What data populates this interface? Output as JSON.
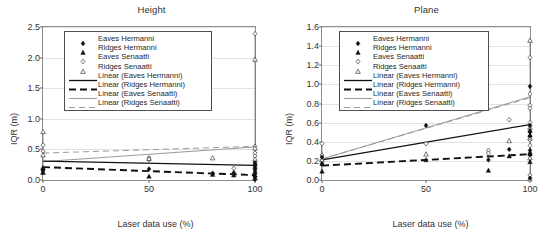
{
  "figure": {
    "panels": [
      "height",
      "plane"
    ]
  },
  "legend": {
    "entries": [
      {
        "label": "Eaves Hermanni",
        "key": "filled-diamond-marker"
      },
      {
        "label": "Ridges Hermanni",
        "key": "filled-triangle-marker"
      },
      {
        "label": "Eaves Senaatti",
        "key": "open-diamond-marker"
      },
      {
        "label": "Ridges Senaatti",
        "key": "open-triangle-marker"
      },
      {
        "label": "Linear (Eaves Hermanni)",
        "key": "solid-black-line"
      },
      {
        "label": "Linear (Ridges Hermanni)",
        "key": "dashed-black-line"
      },
      {
        "label": "Linear (Eaves Senaatti)",
        "key": "solid-gray-line"
      },
      {
        "label": "Linear (Ridges Senaatti)",
        "key": "dashed-gray-line"
      }
    ]
  },
  "colors": {
    "marker_dark": "#111111",
    "marker_open_stroke": "#3d3d3d",
    "trend_dark": "#111111",
    "trend_gray": "#9a9a9a",
    "axis": "#8d8d8d",
    "grid": "#e2e2e2",
    "text": "#333333"
  },
  "chart_data": [
    {
      "id": "height",
      "type": "scatter",
      "title": "Height",
      "xlabel": "Laser data use (%)",
      "ylabel": "IQR (m)",
      "xlim": [
        0,
        100
      ],
      "ylim": [
        0,
        2.5
      ],
      "xticks": [
        0,
        50,
        100
      ],
      "yticks": [
        0.0,
        0.5,
        1.0,
        1.5,
        2.0,
        2.5
      ],
      "ytick_labels": [
        "0.0",
        "0.5",
        "1.0",
        "1.5",
        "2.0",
        "2.5"
      ],
      "xtick_labels": [
        "0",
        "50",
        "100"
      ],
      "grid": "horizontal",
      "legend_position": "top-left",
      "series": [
        {
          "name": "Eaves Hermanni",
          "marker": "filled-diamond",
          "points": [
            {
              "x": 0,
              "y": 0.15
            },
            {
              "x": 0,
              "y": 0.17
            },
            {
              "x": 50,
              "y": 0.18
            },
            {
              "x": 80,
              "y": 0.11
            },
            {
              "x": 90,
              "y": 0.12
            },
            {
              "x": 100,
              "y": 0.28
            },
            {
              "x": 100,
              "y": 0.23
            },
            {
              "x": 100,
              "y": 0.16
            },
            {
              "x": 100,
              "y": 0.1
            },
            {
              "x": 100,
              "y": 0.05
            },
            {
              "x": 100,
              "y": 0.01
            }
          ]
        },
        {
          "name": "Ridges Hermanni",
          "marker": "filled-triangle",
          "points": [
            {
              "x": 0,
              "y": 0.2
            },
            {
              "x": 0,
              "y": 0.12
            },
            {
              "x": 50,
              "y": 0.06
            },
            {
              "x": 80,
              "y": 0.09
            },
            {
              "x": 90,
              "y": 0.08
            },
            {
              "x": 100,
              "y": 0.27
            },
            {
              "x": 100,
              "y": 0.21
            },
            {
              "x": 100,
              "y": 0.14
            },
            {
              "x": 100,
              "y": 0.08
            }
          ]
        },
        {
          "name": "Eaves Senaatti",
          "marker": "open-diamond",
          "points": [
            {
              "x": 0,
              "y": 0.57
            },
            {
              "x": 0,
              "y": 0.47
            },
            {
              "x": 0,
              "y": 0.18
            },
            {
              "x": 50,
              "y": 0.36
            },
            {
              "x": 50,
              "y": 0.33
            },
            {
              "x": 90,
              "y": 0.19
            },
            {
              "x": 100,
              "y": 2.39
            },
            {
              "x": 100,
              "y": 0.55
            },
            {
              "x": 100,
              "y": 0.44
            },
            {
              "x": 100,
              "y": 0.39
            },
            {
              "x": 100,
              "y": 0.31
            },
            {
              "x": 100,
              "y": 0.25
            },
            {
              "x": 100,
              "y": 0.2
            }
          ]
        },
        {
          "name": "Ridges Senaatti",
          "marker": "open-triangle",
          "points": [
            {
              "x": 0,
              "y": 0.79
            },
            {
              "x": 0,
              "y": 0.41
            },
            {
              "x": 0,
              "y": 0.13
            },
            {
              "x": 50,
              "y": 0.35
            },
            {
              "x": 80,
              "y": 0.36
            },
            {
              "x": 100,
              "y": 1.97
            },
            {
              "x": 100,
              "y": 0.52
            },
            {
              "x": 100,
              "y": 0.34
            },
            {
              "x": 100,
              "y": 0.03
            }
          ]
        }
      ],
      "trendlines": [
        {
          "name": "Linear (Eaves Hermanni)",
          "style": "solid-dark",
          "y0": 0.31,
          "y1": 0.24
        },
        {
          "name": "Linear (Ridges Hermanni)",
          "style": "dashed-dark",
          "y0": 0.21,
          "y1": 0.08
        },
        {
          "name": "Linear (Eaves Senaatti)",
          "style": "solid-gray",
          "y0": 0.3,
          "y1": 0.54
        },
        {
          "name": "Linear (Ridges Senaatti)",
          "style": "dashed-gray",
          "y0": 0.44,
          "y1": 0.55
        }
      ]
    },
    {
      "id": "plane",
      "type": "scatter",
      "title": "Plane",
      "xlabel": "Laser data use (%)",
      "ylabel": "IQR (m)",
      "xlim": [
        0,
        100
      ],
      "ylim": [
        0,
        1.6
      ],
      "xticks": [
        0,
        50,
        100
      ],
      "yticks": [
        0.0,
        0.2,
        0.4,
        0.6,
        0.8,
        1.0,
        1.2,
        1.4,
        1.6
      ],
      "ytick_labels": [
        "0.0",
        "0.2",
        "0.4",
        "0.6",
        "0.8",
        "1.0",
        "1.2",
        "1.4",
        "1.6"
      ],
      "xtick_labels": [
        "0",
        "50",
        "100"
      ],
      "grid": "horizontal",
      "legend_position": "top-left",
      "series": [
        {
          "name": "Eaves Hermanni",
          "marker": "filled-diamond",
          "points": [
            {
              "x": 0,
              "y": 0.24
            },
            {
              "x": 0,
              "y": 0.17
            },
            {
              "x": 50,
              "y": 0.57
            },
            {
              "x": 80,
              "y": 0.21
            },
            {
              "x": 90,
              "y": 0.32
            },
            {
              "x": 100,
              "y": 0.98
            },
            {
              "x": 100,
              "y": 0.57
            },
            {
              "x": 100,
              "y": 0.5
            },
            {
              "x": 100,
              "y": 0.46
            },
            {
              "x": 100,
              "y": 0.31
            },
            {
              "x": 100,
              "y": 0.27
            },
            {
              "x": 100,
              "y": 0.02
            }
          ]
        },
        {
          "name": "Ridges Hermanni",
          "marker": "filled-triangle",
          "points": [
            {
              "x": 0,
              "y": 0.17
            },
            {
              "x": 0,
              "y": 0.09
            },
            {
              "x": 50,
              "y": 0.21
            },
            {
              "x": 80,
              "y": 0.1
            },
            {
              "x": 90,
              "y": 0.25
            },
            {
              "x": 100,
              "y": 0.52
            },
            {
              "x": 100,
              "y": 0.47
            },
            {
              "x": 100,
              "y": 0.29
            },
            {
              "x": 100,
              "y": 0.27
            },
            {
              "x": 100,
              "y": 0.19
            }
          ]
        },
        {
          "name": "Eaves Senaatti",
          "marker": "open-diamond",
          "points": [
            {
              "x": 0,
              "y": 0.38
            },
            {
              "x": 0,
              "y": 0.26
            },
            {
              "x": 0,
              "y": 0.21
            },
            {
              "x": 50,
              "y": 0.38
            },
            {
              "x": 80,
              "y": 0.31
            },
            {
              "x": 80,
              "y": 0.28
            },
            {
              "x": 90,
              "y": 0.63
            },
            {
              "x": 100,
              "y": 1.28
            },
            {
              "x": 100,
              "y": 0.9
            },
            {
              "x": 100,
              "y": 0.78
            },
            {
              "x": 100,
              "y": 0.75
            },
            {
              "x": 100,
              "y": 0.6
            },
            {
              "x": 100,
              "y": 0.42
            },
            {
              "x": 100,
              "y": 0.36
            },
            {
              "x": 100,
              "y": 0.05
            }
          ]
        },
        {
          "name": "Ridges Senaatti",
          "marker": "open-triangle",
          "points": [
            {
              "x": 0,
              "y": 0.21
            },
            {
              "x": 50,
              "y": 0.27
            },
            {
              "x": 90,
              "y": 0.41
            },
            {
              "x": 100,
              "y": 1.46
            },
            {
              "x": 100,
              "y": 0.55
            },
            {
              "x": 100,
              "y": 0.44
            },
            {
              "x": 100,
              "y": 0.23
            },
            {
              "x": 100,
              "y": 0.01
            }
          ]
        }
      ],
      "trendlines": [
        {
          "name": "Linear (Eaves Hermanni)",
          "style": "solid-dark",
          "y0": 0.21,
          "y1": 0.58
        },
        {
          "name": "Linear (Ridges Hermanni)",
          "style": "dashed-dark",
          "y0": 0.15,
          "y1": 0.27
        },
        {
          "name": "Linear (Eaves Senaatti)",
          "style": "solid-gray",
          "y0": 0.22,
          "y1": 0.87
        },
        {
          "name": "Linear (Ridges Senaatti)",
          "style": "dashed-gray",
          "y0": 0.22,
          "y1": 0.86
        }
      ]
    }
  ]
}
